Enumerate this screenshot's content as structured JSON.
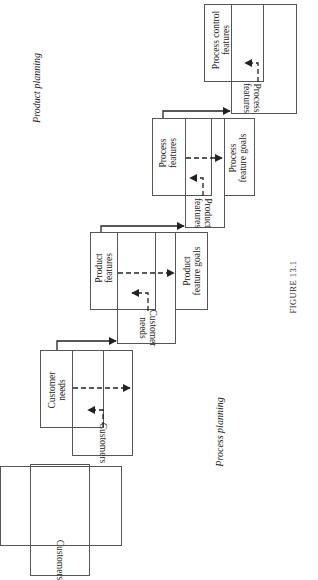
{
  "figure": {
    "caption": "FIGURE 13.1",
    "orientation": "rotated 90° counter-clockwise",
    "side_labels": {
      "top": "Product planning",
      "bottom": "Process planning"
    },
    "stages": [
      {
        "input_label": "Customers",
        "output_label": ""
      },
      {
        "input_label": "Customers",
        "output_label": "Customer\nneeds",
        "output_line1": "Customer",
        "output_line2": "needs"
      },
      {
        "input_label_line1": "Customer",
        "input_label_line2": "needs",
        "output_line1": "Product",
        "output_line2": "features",
        "goal_line1": "Product",
        "goal_line2": "feature goals"
      },
      {
        "input_label_line1": "Product",
        "input_label_line2": "features",
        "output_line1": "Process",
        "output_line2": "features",
        "goal_line1": "Process",
        "goal_line2": "feature goals"
      },
      {
        "input_label_line1": "Process",
        "input_label_line2": "features",
        "output_line1": "Process control",
        "output_line2": "features"
      }
    ]
  },
  "colors": {
    "line": "#555555",
    "arrow": "#222222",
    "text": "#222222",
    "background": "#ffffff"
  }
}
